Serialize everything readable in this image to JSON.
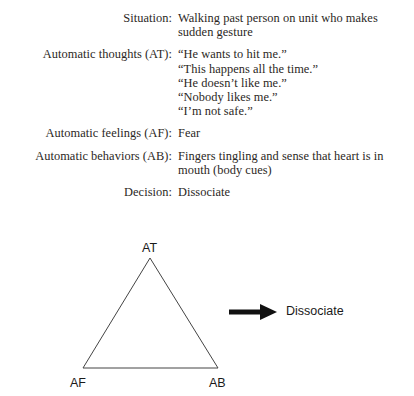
{
  "document": {
    "type": "cbt-case-formulation",
    "rows": [
      {
        "label": "Situation:",
        "lines": [
          "Walking past person on unit who makes sudden gesture"
        ],
        "wrap": true
      },
      {
        "label": "Automatic thoughts (AT):",
        "lines": [
          "“He wants to hit me.”",
          "“This happens all the time.”",
          "“He doesn’t like me.”",
          "“Nobody likes me.”",
          "“I’m not safe.”"
        ],
        "wrap": false
      },
      {
        "label": "Automatic feelings (AF):",
        "lines": [
          "Fear"
        ],
        "wrap": false
      },
      {
        "label": "Automatic behaviors (AB):",
        "lines": [
          "Fingers tingling and sense that heart is in mouth (body cues)"
        ],
        "wrap": true
      },
      {
        "label": "Decision:",
        "lines": [
          "Dissociate"
        ],
        "wrap": false
      }
    ]
  },
  "diagram": {
    "vertices": {
      "top": "AT",
      "bottom_left": "AF",
      "bottom_right": "AB"
    },
    "arrow": {
      "icon": "right-arrow-icon",
      "target_label": "Dissociate"
    },
    "geometry": {
      "apex_x": 150,
      "apex_y": 28,
      "base_left_x": 83,
      "base_right_x": 218,
      "base_y": 138,
      "arrow_start_x": 229,
      "arrow_tip_x": 277,
      "arrow_y": 82
    },
    "colors": {
      "line": "#444444",
      "arrow": "#111111",
      "text": "#1a1a1a"
    }
  }
}
